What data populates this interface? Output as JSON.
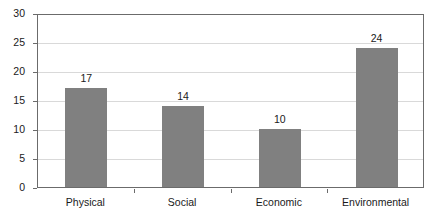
{
  "chart_data": {
    "type": "bar",
    "title": "",
    "subtitle": "",
    "xlabel": "",
    "ylabel": "",
    "categories": [
      "Physical",
      "Social",
      "Economic",
      "Environmental"
    ],
    "values": [
      17,
      14,
      10,
      24
    ],
    "data_labels": [
      "17",
      "14",
      "10",
      "24"
    ],
    "ylim": [
      0,
      30
    ],
    "ytick_step": 5,
    "ytick_labels": [
      "0",
      "5",
      "10",
      "15",
      "20",
      "25",
      "30"
    ],
    "ytick_values": [
      0,
      5,
      10,
      15,
      20,
      25,
      30
    ],
    "grid": "horizontal",
    "legend": "none",
    "bar_color": "#808080",
    "gridline_color": "#d9d9d9",
    "axis_color": "#6b6b6b",
    "text_color": "#1a1a1a",
    "background_color": "#ffffff"
  }
}
